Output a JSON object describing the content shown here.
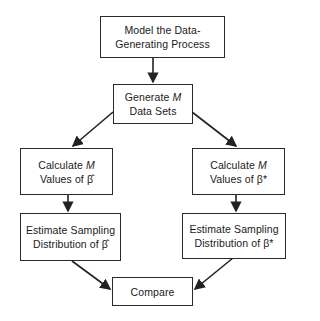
{
  "diagram": {
    "nodes": [
      {
        "id": "model",
        "lines": [
          "Model the Data-",
          "Generating Process"
        ]
      },
      {
        "id": "generate",
        "lines": [
          "Generate M",
          "Data Sets"
        ]
      },
      {
        "id": "calc_hat",
        "lines": [
          "Calculate M",
          "Values of β̂"
        ]
      },
      {
        "id": "calc_star",
        "lines": [
          "Calculate M",
          "Values of β*"
        ]
      },
      {
        "id": "est_hat",
        "lines": [
          "Estimate Sampling",
          "Distribution of β̂"
        ]
      },
      {
        "id": "est_star",
        "lines": [
          "Estimate Sampling",
          "Distribution of β*"
        ]
      },
      {
        "id": "compare",
        "lines": [
          "Compare"
        ]
      }
    ],
    "edges": [
      {
        "from": "model",
        "to": "generate"
      },
      {
        "from": "generate",
        "to": "calc_hat"
      },
      {
        "from": "generate",
        "to": "calc_star"
      },
      {
        "from": "calc_hat",
        "to": "est_hat"
      },
      {
        "from": "calc_star",
        "to": "est_star"
      },
      {
        "from": "est_hat",
        "to": "compare"
      },
      {
        "from": "est_star",
        "to": "compare"
      }
    ]
  },
  "labels": {
    "model_1": "Model the Data-",
    "model_2": "Generating Process",
    "generate_1": "Generate ",
    "generate_M": "M",
    "generate_2": "Data Sets",
    "calc_hat_1": "Calculate ",
    "calc_hat_M": "M",
    "calc_hat_2": "Values of β̂",
    "calc_star_1": "Calculate ",
    "calc_star_M": "M",
    "calc_star_2": "Values of β*",
    "est_hat_1": "Estimate Sampling",
    "est_hat_2": "Distribution of β̂",
    "est_star_1": "Estimate Sampling",
    "est_star_2": "Distribution of β*",
    "compare": "Compare"
  }
}
